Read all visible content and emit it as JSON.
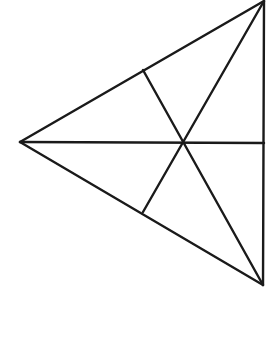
{
  "diagram": {
    "type": "geometry-figure",
    "stroke_color": "#1a1a1a",
    "background": "#ffffff",
    "stroke_width": 2.4,
    "vertices": {
      "top_right": [
        264,
        1
      ],
      "bottom_right": [
        263,
        285
      ],
      "left": [
        20,
        142
      ]
    },
    "interior_point": [
      183,
      143
    ],
    "feet": {
      "on_top_edge": [
        143,
        70
      ],
      "on_bottom_edge": [
        143,
        212
      ],
      "on_right_edge": [
        264,
        143
      ]
    },
    "segments": [
      {
        "name": "side-top",
        "from": [
          20,
          142
        ],
        "to": [
          264,
          1
        ]
      },
      {
        "name": "side-right",
        "from": [
          264,
          1
        ],
        "to": [
          263,
          285
        ]
      },
      {
        "name": "side-bottom",
        "from": [
          20,
          142
        ],
        "to": [
          263,
          285
        ]
      },
      {
        "name": "cevian-horizontal",
        "from": [
          20,
          142
        ],
        "to": [
          264,
          143
        ]
      },
      {
        "name": "cevian-top-right-to-bottom-foot",
        "from": [
          264,
          1
        ],
        "to": [
          143,
          212
        ]
      },
      {
        "name": "cevian-bottom-right-to-top-foot",
        "from": [
          263,
          285
        ],
        "to": [
          143,
          70
        ]
      }
    ]
  }
}
